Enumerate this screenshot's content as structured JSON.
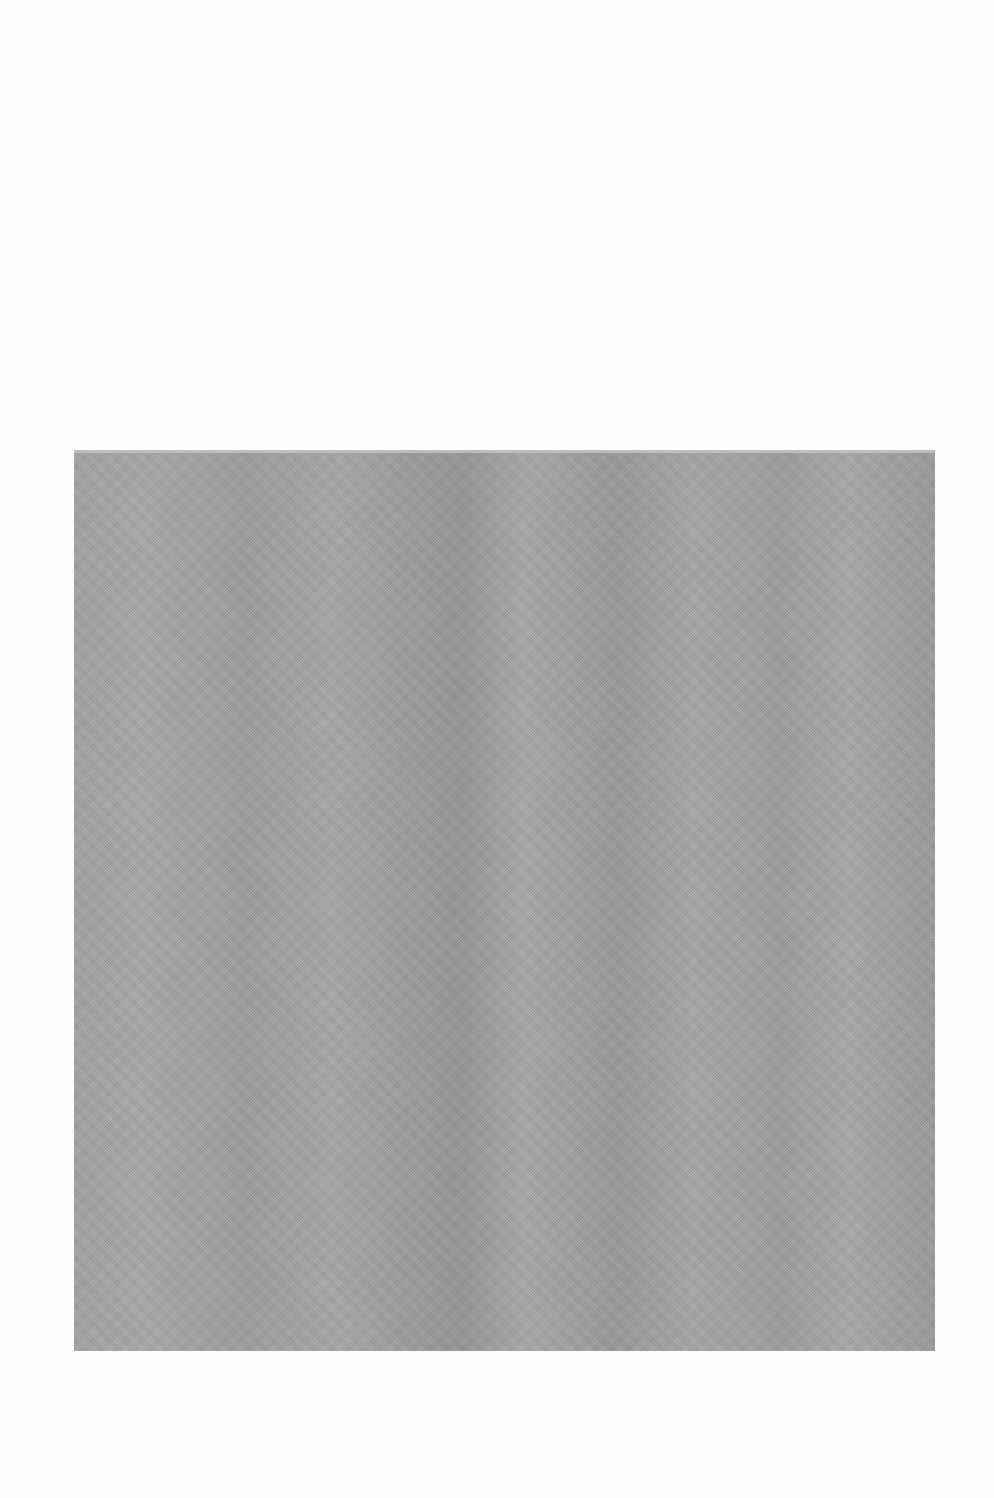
{
  "page": {
    "background_color": "#ffffff"
  },
  "plate": {
    "description": "blank halftone gray image plate",
    "fill_color": "#a3a3a3",
    "bounds": {
      "left": 74,
      "top": 450,
      "width": 861,
      "height": 901
    }
  }
}
